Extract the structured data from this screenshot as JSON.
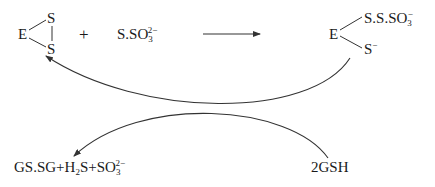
{
  "diagram": {
    "type": "reaction-scheme",
    "reactant_cyclic": {
      "center": "E",
      "top": "S",
      "bottom": "S"
    },
    "plus_sign": "+",
    "thiosulfate": {
      "base": "S.SO",
      "sub": "3",
      "sup": "2−"
    },
    "product_adduct": {
      "center": "E",
      "upper_branch": {
        "base": "S.S.SO",
        "sub": "3",
        "sup": "−"
      },
      "lower_branch": {
        "base": "S",
        "sup": "−"
      }
    },
    "byproducts": {
      "part1": "GS.SG+H",
      "part1_sub": "2",
      "part2": "S+SO",
      "part2_sub": "3",
      "part2_sup": "2−"
    },
    "reductant": "2GSH",
    "arrows": [
      {
        "from": "reactants",
        "to": "product_adduct",
        "style": "straight"
      },
      {
        "from": "product_adduct",
        "to": "reactant_cyclic",
        "style": "curved"
      },
      {
        "from": "reductant",
        "to": "byproducts",
        "style": "curved"
      }
    ],
    "line_color": "#333333"
  }
}
